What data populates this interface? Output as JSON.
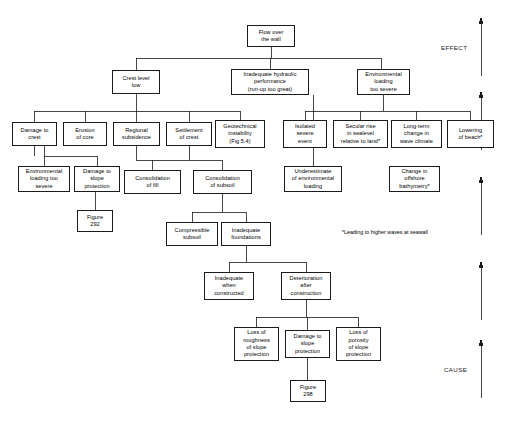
{
  "diagram": {
    "title_node": {
      "label": "Flow over\nthe wall"
    },
    "footnote": "*Leading to higher waves at seawall",
    "margin_labels": {
      "effect": "EFFECT",
      "cause": "CAUSE"
    },
    "colors": {
      "line": "#1a1a1a",
      "box_border": "#1a1a1a",
      "background": "#ffffff",
      "text": "#000000"
    },
    "nodes": [
      {
        "id": "flow-over-the-wall",
        "label": "Flow over\nthe wall",
        "x": 247,
        "y": 25,
        "w": 48,
        "h": 22,
        "tier": 1
      },
      {
        "id": "crest-level-low",
        "label": "Crest level\nlow",
        "x": 112,
        "y": 70,
        "w": 48,
        "h": 24,
        "tier": 2
      },
      {
        "id": "inadequate-hydraulic-performance",
        "label": "Inadequate hydraulic\nperformance\n(run-up too great)",
        "x": 231,
        "y": 69,
        "w": 78,
        "h": 26,
        "tier": 2
      },
      {
        "id": "environmental-loading-too-severe-top",
        "label": "Environmental\nloading\ntoo severe",
        "x": 357,
        "y": 69,
        "w": 53,
        "h": 26,
        "tier": 2
      },
      {
        "id": "damage-to-crest",
        "label": "Damage to\ncrest",
        "x": 12,
        "y": 122,
        "w": 45,
        "h": 24,
        "tier": 3
      },
      {
        "id": "erosion-of-core",
        "label": "Erosion\nof core",
        "x": 63,
        "y": 122,
        "w": 44,
        "h": 24,
        "tier": 3
      },
      {
        "id": "regional-subsidence",
        "label": "Regional\nsubsidence",
        "x": 113,
        "y": 122,
        "w": 47,
        "h": 24,
        "tier": 3
      },
      {
        "id": "settlement-of-crest",
        "label": "Settlement\nof crest",
        "x": 166,
        "y": 122,
        "w": 46,
        "h": 24,
        "tier": 3
      },
      {
        "id": "geotechnical-instability",
        "label": "Geotechnical\ninstability\n(Fig 5.4)",
        "x": 215,
        "y": 120,
        "w": 50,
        "h": 28,
        "tier": 3
      },
      {
        "id": "isolated-severe-event",
        "label": "Isolated\nsevere\nevent",
        "x": 283,
        "y": 120,
        "w": 44,
        "h": 28,
        "tier": 3
      },
      {
        "id": "secular-rise-in-sealevel",
        "label": "Secular rise\nin sealevel\nrelative to land*",
        "x": 333,
        "y": 120,
        "w": 55,
        "h": 28,
        "tier": 3
      },
      {
        "id": "long-term-change-in-wave-climate",
        "label": "Long-term\nchange in\nwave climate",
        "x": 391,
        "y": 120,
        "w": 51,
        "h": 28,
        "tier": 3
      },
      {
        "id": "lowering-of-beach",
        "label": "Lowering\nof beach*",
        "x": 447,
        "y": 120,
        "w": 47,
        "h": 28,
        "tier": 3
      },
      {
        "id": "environmental-loading-too-severe-lower",
        "label": "Environmental\nloading too\nsevere",
        "x": 18,
        "y": 166,
        "w": 52,
        "h": 26,
        "tier": 4
      },
      {
        "id": "damage-to-slope-protection-upper",
        "label": "Damage to\nslope\nprotection",
        "x": 74,
        "y": 166,
        "w": 46,
        "h": 26,
        "tier": 4
      },
      {
        "id": "consolidation-of-fill",
        "label": "Consolidation\nof fill",
        "x": 124,
        "y": 170,
        "w": 57,
        "h": 24,
        "tier": 4
      },
      {
        "id": "consolidation-of-subsoil",
        "label": "Consolidation\nof subsoil",
        "x": 193,
        "y": 170,
        "w": 59,
        "h": 24,
        "tier": 4
      },
      {
        "id": "underestimate-of-environmental-loading",
        "label": "Underestimate\nof environmental\nloading",
        "x": 284,
        "y": 166,
        "w": 58,
        "h": 26,
        "tier": 4
      },
      {
        "id": "change-in-offshore-bathymetry",
        "label": "Change in\noffshore\nbathymetry*",
        "x": 389,
        "y": 166,
        "w": 51,
        "h": 26,
        "tier": 4
      },
      {
        "id": "figure-292",
        "label": "Figure\n292",
        "x": 77,
        "y": 210,
        "w": 36,
        "h": 22,
        "tier": 5,
        "kind": "figure-ref"
      },
      {
        "id": "compressible-subsoil",
        "label": "Compressible\nsubsoil",
        "x": 166,
        "y": 222,
        "w": 52,
        "h": 24,
        "tier": 5
      },
      {
        "id": "inadequate-foundations",
        "label": "Inadequate\nfoundations",
        "x": 221,
        "y": 222,
        "w": 50,
        "h": 24,
        "tier": 5
      },
      {
        "id": "inadequate-when-constructed",
        "label": "Inadequate\nwhen\nconstructed",
        "x": 204,
        "y": 272,
        "w": 50,
        "h": 28,
        "tier": 6
      },
      {
        "id": "deterioration-after-construction",
        "label": "Deterioration\nafter\nconstruction",
        "x": 281,
        "y": 272,
        "w": 50,
        "h": 28,
        "tier": 6
      },
      {
        "id": "loss-of-roughness-of-slope-protection",
        "label": "Loss of\nroughness\nof slope\nprotection",
        "x": 234,
        "y": 327,
        "w": 45,
        "h": 34,
        "tier": 7
      },
      {
        "id": "damage-to-slope-protection-lower",
        "label": "Damage to\nslope\nprotection",
        "x": 285,
        "y": 330,
        "w": 45,
        "h": 28,
        "tier": 7
      },
      {
        "id": "loss-of-porosity-of-slope-protection",
        "label": "Loss of\nporosity\nof slope\nprotection",
        "x": 336,
        "y": 327,
        "w": 45,
        "h": 34,
        "tier": 7
      },
      {
        "id": "figure-298",
        "label": "Figure\n298",
        "x": 290,
        "y": 380,
        "w": 36,
        "h": 22,
        "tier": 8,
        "kind": "figure-ref"
      }
    ],
    "arrows": [
      {
        "id": "arrow-effect-1",
        "x": 481,
        "y_top": 18,
        "y_bottom": 76
      },
      {
        "id": "arrow-effect-2",
        "x": 481,
        "y_top": 92,
        "y_bottom": 150
      },
      {
        "id": "arrow-mid",
        "x": 481,
        "y_top": 177,
        "y_bottom": 235
      },
      {
        "id": "arrow-cause-2",
        "x": 481,
        "y_top": 262,
        "y_bottom": 320
      },
      {
        "id": "arrow-cause-1",
        "x": 481,
        "y_top": 340,
        "y_bottom": 398
      }
    ]
  }
}
